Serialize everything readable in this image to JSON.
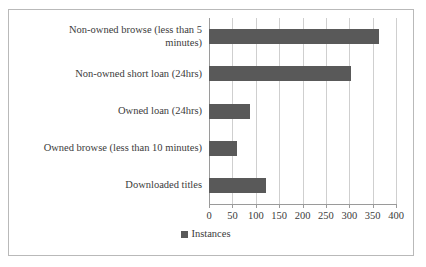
{
  "chart_data": {
    "type": "bar",
    "orientation": "horizontal",
    "title": "",
    "xlabel": "",
    "ylabel": "",
    "categories": [
      "Non-owned browse (less than 5\nminutes)",
      "Non-owned short loan (24hrs)",
      "Owned  loan (24hrs)",
      "Owned browse (less than 10 minutes)",
      "Downloaded titles"
    ],
    "series": [
      {
        "name": "Instances",
        "values": [
          363,
          303,
          88,
          60,
          122
        ],
        "color": "#595959"
      }
    ],
    "xlim": [
      0,
      400
    ],
    "xticks": [
      0,
      50,
      100,
      150,
      200,
      250,
      300,
      350,
      400
    ],
    "xtick_labels": [
      "0",
      "50",
      "100",
      "150",
      "200",
      "250",
      "300",
      "350",
      "400"
    ],
    "grid": true,
    "grid_axis": "x",
    "legend": {
      "position": "bottom",
      "entries": [
        {
          "label": "Instances",
          "color": "#595959",
          "marker": "square-swatch"
        }
      ]
    },
    "frame": {
      "border_color": "#b9b9b9",
      "background": "#ffffff"
    },
    "axis_color": "#9a9a9a",
    "gridline_color": "#cfcfcf"
  }
}
